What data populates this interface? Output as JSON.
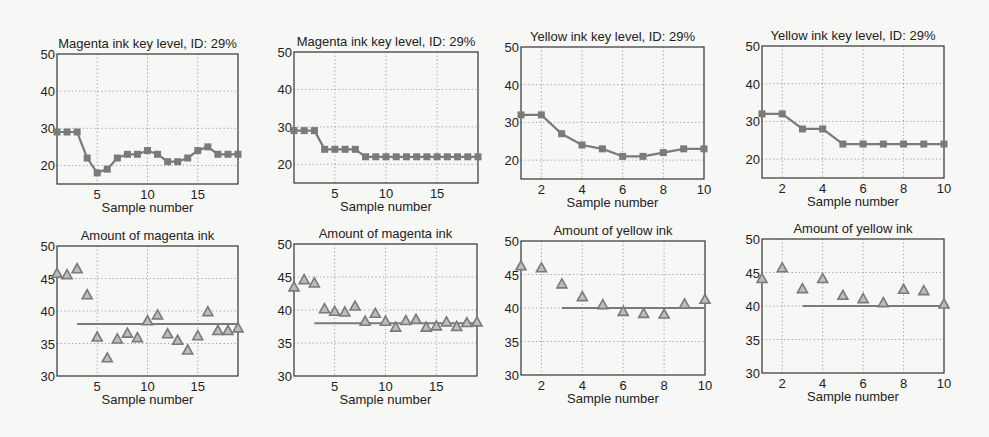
{
  "colors": {
    "series": "#7a7a7a",
    "axis": "#333333",
    "grid": "#888888",
    "background": "#f7f7f5"
  },
  "chart_data": [
    {
      "type": "line",
      "id": "p1",
      "title": "Magenta ink key level, ID:  29%",
      "xlabel": "Sample number",
      "ylabel": "",
      "box": [
        57,
        54,
        238,
        184
      ],
      "xlim": [
        1,
        19
      ],
      "ylim": [
        15,
        50
      ],
      "xticks": [
        5,
        10,
        15
      ],
      "yticks": [
        20,
        30,
        40,
        50
      ],
      "grid": true,
      "marker": "square",
      "x": [
        1,
        2,
        3,
        4,
        5,
        6,
        7,
        8,
        9,
        10,
        11,
        12,
        13,
        14,
        15,
        16,
        17,
        18,
        19
      ],
      "values": [
        29,
        29,
        29,
        22,
        18,
        19,
        22,
        23,
        23,
        24,
        23,
        21,
        21,
        22,
        24,
        25,
        23,
        23,
        23
      ]
    },
    {
      "type": "line",
      "id": "p2",
      "title": "Magenta ink key level, ID:  29%",
      "xlabel": "Sample number",
      "ylabel": "",
      "box": [
        294,
        52,
        478,
        183
      ],
      "xlim": [
        1,
        19
      ],
      "ylim": [
        15,
        50
      ],
      "xticks": [
        5,
        10,
        15
      ],
      "yticks": [
        20,
        30,
        40,
        50
      ],
      "grid": true,
      "marker": "square",
      "x": [
        1,
        2,
        3,
        4,
        5,
        6,
        7,
        8,
        9,
        10,
        11,
        12,
        13,
        14,
        15,
        16,
        17,
        18,
        19
      ],
      "values": [
        29,
        29,
        29,
        24,
        24,
        24,
        24,
        22,
        22,
        22,
        22,
        22,
        22,
        22,
        22,
        22,
        22,
        22,
        22
      ]
    },
    {
      "type": "line",
      "id": "p3",
      "title": "Yellow ink key level, ID:  29%",
      "xlabel": "Sample number",
      "ylabel": "",
      "box": [
        521,
        47,
        704,
        179
      ],
      "xlim": [
        1,
        10
      ],
      "ylim": [
        15,
        50
      ],
      "xticks": [
        2,
        4,
        6,
        8,
        10
      ],
      "yticks": [
        20,
        30,
        40,
        50
      ],
      "grid": true,
      "marker": "square",
      "x": [
        1,
        2,
        3,
        4,
        5,
        6,
        7,
        8,
        9,
        10
      ],
      "values": [
        32,
        32,
        27,
        24,
        23,
        21,
        21,
        22,
        23,
        23
      ]
    },
    {
      "type": "line",
      "id": "p4",
      "title": "Yellow ink key level, ID:  29%",
      "xlabel": "Sample number",
      "ylabel": "",
      "box": [
        762,
        46,
        944,
        178
      ],
      "xlim": [
        1,
        10
      ],
      "ylim": [
        15,
        50
      ],
      "xticks": [
        2,
        4,
        6,
        8,
        10
      ],
      "yticks": [
        20,
        30,
        40,
        50
      ],
      "grid": true,
      "marker": "square",
      "x": [
        1,
        2,
        3,
        4,
        5,
        6,
        7,
        8,
        9,
        10
      ],
      "values": [
        32,
        32,
        28,
        28,
        24,
        24,
        24,
        24,
        24,
        24
      ]
    },
    {
      "type": "scatter",
      "id": "p5",
      "title": "Amount of magenta ink",
      "xlabel": "Sample number",
      "ylabel": "",
      "box": [
        57,
        246,
        238,
        376
      ],
      "xlim": [
        1,
        19
      ],
      "ylim": [
        30,
        50
      ],
      "xticks": [
        5,
        10,
        15
      ],
      "yticks": [
        30,
        35,
        40,
        45,
        50
      ],
      "grid": true,
      "marker": "triangle",
      "x": [
        1,
        2,
        3,
        4,
        5,
        6,
        7,
        8,
        9,
        10,
        11,
        12,
        13,
        14,
        15,
        16,
        17,
        18,
        19
      ],
      "values": [
        45.8,
        45.6,
        46.5,
        42.5,
        36.0,
        32.8,
        35.7,
        36.6,
        35.9,
        38.5,
        39.4,
        36.5,
        35.5,
        34.0,
        36.2,
        39.9,
        37.0,
        37.0,
        37.4
      ],
      "target": {
        "value": 38,
        "x_start": 3,
        "x_end": 19
      }
    },
    {
      "type": "scatter",
      "id": "p6",
      "title": "Amount of magenta ink",
      "xlabel": "Sample number",
      "ylabel": "",
      "box": [
        294,
        244,
        477,
        376
      ],
      "xlim": [
        1,
        19
      ],
      "ylim": [
        30,
        50
      ],
      "xticks": [
        5,
        10,
        15
      ],
      "yticks": [
        30,
        35,
        40,
        45,
        50
      ],
      "grid": true,
      "marker": "triangle",
      "x": [
        1,
        2,
        3,
        4,
        5,
        6,
        7,
        8,
        9,
        10,
        11,
        12,
        13,
        14,
        15,
        16,
        17,
        18,
        19
      ],
      "values": [
        43.5,
        44.6,
        44.1,
        40.2,
        39.8,
        39.7,
        40.6,
        38.3,
        39.5,
        38.3,
        37.4,
        38.4,
        38.6,
        37.4,
        37.6,
        38.2,
        37.5,
        38.1,
        38.2
      ],
      "target": {
        "value": 38,
        "x_start": 3,
        "x_end": 19
      }
    },
    {
      "type": "scatter",
      "id": "p7",
      "title": "Amount of yellow ink",
      "xlabel": "Sample number",
      "ylabel": "",
      "box": [
        521,
        241,
        705,
        375
      ],
      "xlim": [
        1,
        10
      ],
      "ylim": [
        30,
        50
      ],
      "xticks": [
        2,
        4,
        6,
        8,
        10
      ],
      "yticks": [
        30,
        35,
        40,
        45,
        50
      ],
      "grid": true,
      "marker": "triangle",
      "x": [
        1,
        2,
        3,
        4,
        5,
        6,
        7,
        8,
        9,
        10
      ],
      "values": [
        46.3,
        46.0,
        43.6,
        41.7,
        40.5,
        39.5,
        39.2,
        39.1,
        40.6,
        41.3
      ],
      "target": {
        "value": 40,
        "x_start": 3,
        "x_end": 10
      }
    },
    {
      "type": "scatter",
      "id": "p8",
      "title": "Amount of yellow ink",
      "xlabel": "Sample number",
      "ylabel": "",
      "box": [
        762,
        239,
        944,
        373
      ],
      "xlim": [
        1,
        10
      ],
      "ylim": [
        30,
        50
      ],
      "xticks": [
        2,
        4,
        6,
        8,
        10
      ],
      "yticks": [
        30,
        35,
        40,
        45,
        50
      ],
      "grid": true,
      "marker": "triangle",
      "x": [
        1,
        2,
        3,
        4,
        5,
        6,
        7,
        8,
        9,
        10
      ],
      "values": [
        44.1,
        45.7,
        42.6,
        44.1,
        41.6,
        41.1,
        40.5,
        42.5,
        42.3,
        40.3
      ],
      "target": {
        "value": 40,
        "x_start": 3,
        "x_end": 10
      }
    }
  ]
}
